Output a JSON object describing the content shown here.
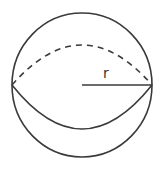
{
  "diagram": {
    "label_radius": "r",
    "stroke_color": "#3a3a3a",
    "shapes": {
      "outer_circle": {
        "cx": 82,
        "cy": 85,
        "rx": 70,
        "ry": 72
      },
      "equator_front": {
        "from": [
          12,
          85
        ],
        "to": [
          152,
          85
        ],
        "depth": 44,
        "style": "solid"
      },
      "equator_back": {
        "from": [
          12,
          85
        ],
        "to": [
          152,
          85
        ],
        "depth": 40,
        "style": "dashed"
      },
      "radius_line": {
        "from": [
          82,
          85
        ],
        "to": [
          152,
          85
        ]
      }
    }
  }
}
